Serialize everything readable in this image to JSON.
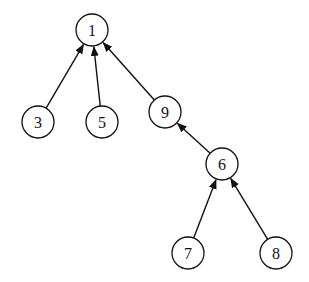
{
  "diagram": {
    "type": "tree",
    "nodes": [
      {
        "id": "1",
        "label": "1",
        "x": 92,
        "y": 30
      },
      {
        "id": "3",
        "label": "3",
        "x": 38,
        "y": 122
      },
      {
        "id": "5",
        "label": "5",
        "x": 102,
        "y": 122
      },
      {
        "id": "9",
        "label": "9",
        "x": 165,
        "y": 112
      },
      {
        "id": "6",
        "label": "6",
        "x": 222,
        "y": 164
      },
      {
        "id": "7",
        "label": "7",
        "x": 188,
        "y": 253
      },
      {
        "id": "8",
        "label": "8",
        "x": 276,
        "y": 253
      }
    ],
    "edges": [
      {
        "from": "3",
        "to": "1"
      },
      {
        "from": "5",
        "to": "1"
      },
      {
        "from": "9",
        "to": "1"
      },
      {
        "from": "6",
        "to": "9"
      },
      {
        "from": "7",
        "to": "6"
      },
      {
        "from": "8",
        "to": "6"
      }
    ]
  }
}
